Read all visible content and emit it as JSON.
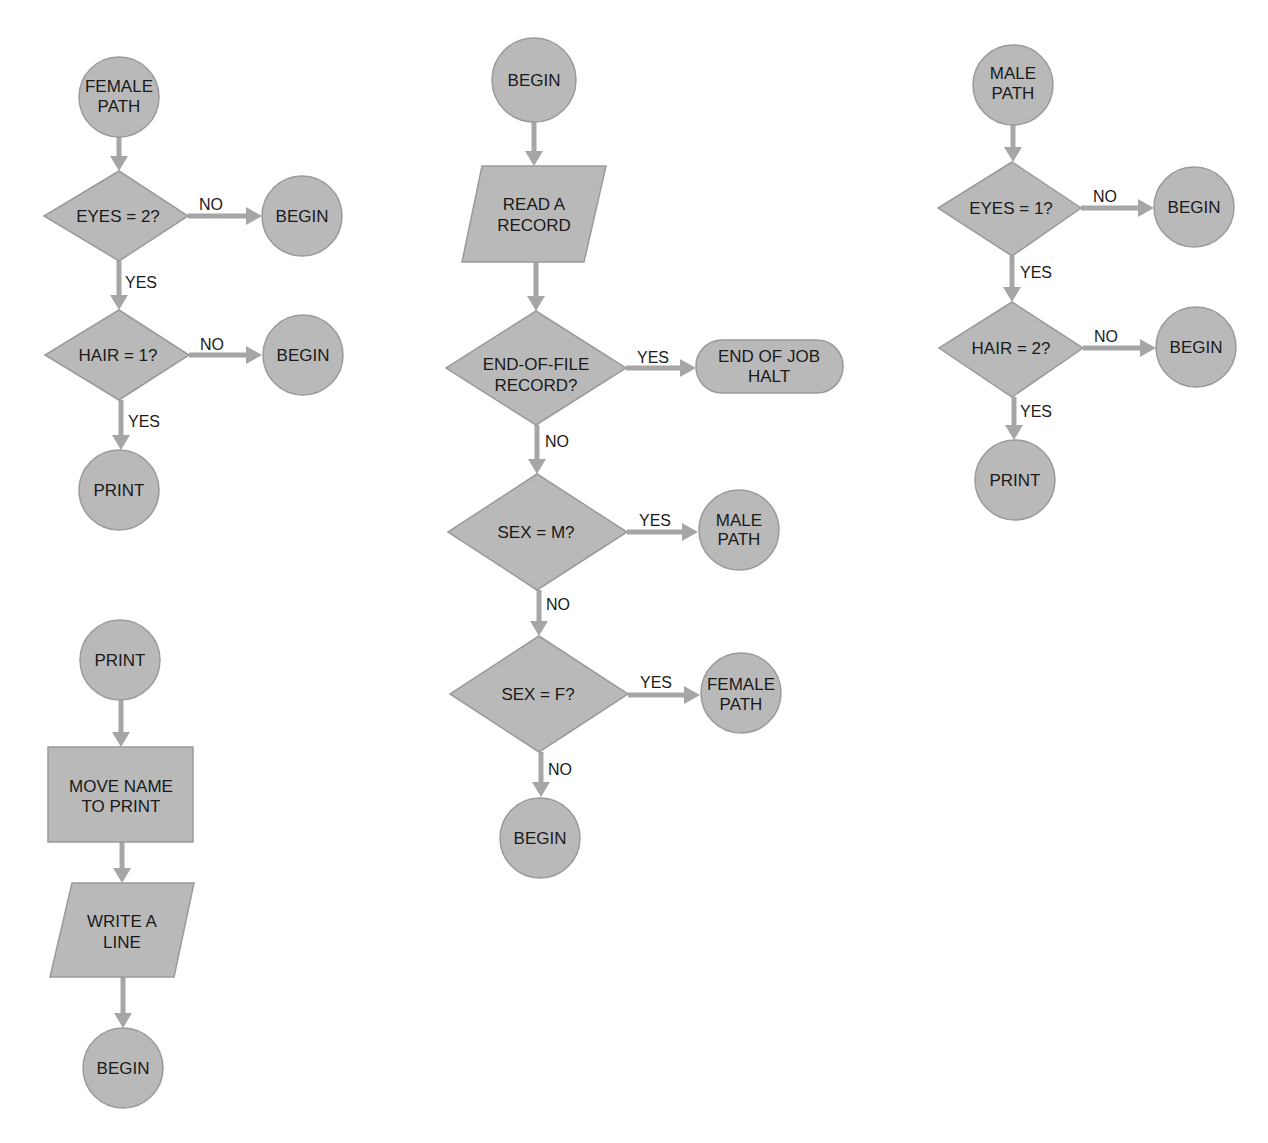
{
  "colors": {
    "shape_fill": "#b9b9b9",
    "shape_stroke": "#9a9a9a",
    "arrow": "#a6a6a6",
    "text": "#1a1a1a",
    "background": "#ffffff"
  },
  "nodes": {
    "female_start": {
      "type": "connector",
      "lines": [
        "FEMALE",
        "PATH"
      ]
    },
    "female_eyes": {
      "type": "decision",
      "lines": [
        "EYES = 2?"
      ]
    },
    "female_eyes_no": {
      "type": "connector",
      "lines": [
        "BEGIN"
      ]
    },
    "female_hair": {
      "type": "decision",
      "lines": [
        "HAIR = 1?"
      ]
    },
    "female_hair_no": {
      "type": "connector",
      "lines": [
        "BEGIN"
      ]
    },
    "female_print": {
      "type": "connector",
      "lines": [
        "PRINT"
      ]
    },
    "main_begin": {
      "type": "connector",
      "lines": [
        "BEGIN"
      ]
    },
    "main_read": {
      "type": "io",
      "lines": [
        "READ A",
        "RECORD"
      ]
    },
    "main_eof": {
      "type": "decision",
      "lines": [
        "END-OF-FILE",
        "RECORD?"
      ]
    },
    "main_halt": {
      "type": "terminal",
      "lines": [
        "END OF JOB",
        "HALT"
      ]
    },
    "main_sex_m": {
      "type": "decision",
      "lines": [
        "SEX = M?"
      ]
    },
    "main_male_path": {
      "type": "connector",
      "lines": [
        "MALE",
        "PATH"
      ]
    },
    "main_sex_f": {
      "type": "decision",
      "lines": [
        "SEX = F?"
      ]
    },
    "main_female_path": {
      "type": "connector",
      "lines": [
        "FEMALE",
        "PATH"
      ]
    },
    "main_end_begin": {
      "type": "connector",
      "lines": [
        "BEGIN"
      ]
    },
    "male_start": {
      "type": "connector",
      "lines": [
        "MALE",
        "PATH"
      ]
    },
    "male_eyes": {
      "type": "decision",
      "lines": [
        "EYES = 1?"
      ]
    },
    "male_eyes_no": {
      "type": "connector",
      "lines": [
        "BEGIN"
      ]
    },
    "male_hair": {
      "type": "decision",
      "lines": [
        "HAIR = 2?"
      ]
    },
    "male_hair_no": {
      "type": "connector",
      "lines": [
        "BEGIN"
      ]
    },
    "male_print": {
      "type": "connector",
      "lines": [
        "PRINT"
      ]
    },
    "print_start": {
      "type": "connector",
      "lines": [
        "PRINT"
      ]
    },
    "print_move": {
      "type": "process",
      "lines": [
        "MOVE NAME",
        "TO PRINT"
      ]
    },
    "print_write": {
      "type": "io",
      "lines": [
        "WRITE A",
        "LINE"
      ]
    },
    "print_begin": {
      "type": "connector",
      "lines": [
        "BEGIN"
      ]
    }
  },
  "edges": {
    "female_eyes_no": "NO",
    "female_eyes_yes": "YES",
    "female_hair_no": "NO",
    "female_hair_yes": "YES",
    "main_eof_yes": "YES",
    "main_eof_no": "NO",
    "main_sex_m_yes": "YES",
    "main_sex_m_no": "NO",
    "main_sex_f_yes": "YES",
    "main_sex_f_no": "NO",
    "male_eyes_no": "NO",
    "male_eyes_yes": "YES",
    "male_hair_no": "NO",
    "male_hair_yes": "YES"
  }
}
